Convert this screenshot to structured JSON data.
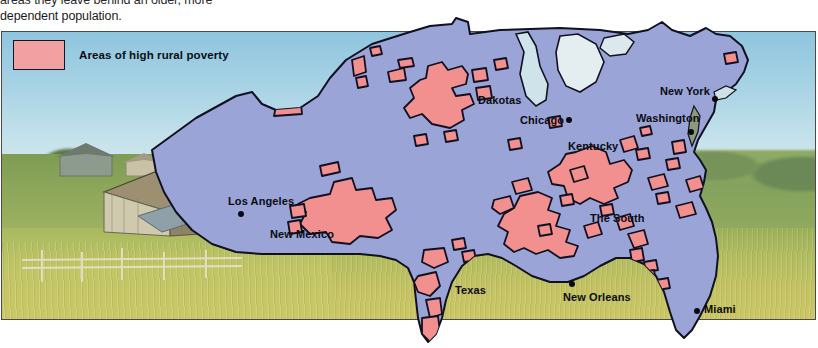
{
  "caption": {
    "line1": "areas they leave behind an older, more",
    "line2": "dependent population."
  },
  "legend": {
    "swatch_name": "poverty-area-swatch",
    "label": "Areas of high rural poverty",
    "swatch_color": "#f2a0a2",
    "swatch_border": "#15151a"
  },
  "map": {
    "title": "United States rural poverty map",
    "land_color": "#9aa4d6",
    "land_outline": "#101020",
    "poverty_color": "#f2908f",
    "poverty_outline": "#101020",
    "regions": [
      {
        "name": "Dakotas",
        "label": "Dakotas",
        "x": 478,
        "y": 100
      },
      {
        "name": "Kentucky",
        "label": "Kentucky",
        "x": 568,
        "y": 146
      },
      {
        "name": "The South",
        "label": "The South",
        "x": 590,
        "y": 218
      },
      {
        "name": "New Mexico",
        "label": "New Mexico",
        "x": 270,
        "y": 234
      },
      {
        "name": "Texas",
        "label": "Texas",
        "x": 455,
        "y": 290
      }
    ],
    "cities": [
      {
        "name": "Chicago",
        "label": "Chicago",
        "label_x": 520,
        "label_y": 120,
        "dot_x": 566,
        "dot_y": 119
      },
      {
        "name": "New York",
        "label": "New York",
        "label_x": 660,
        "label_y": 91,
        "dot_x": 712,
        "dot_y": 98
      },
      {
        "name": "Washington",
        "label": "Washington",
        "label_x": 636,
        "label_y": 118,
        "dot_x": 688,
        "dot_y": 131
      },
      {
        "name": "Los Angeles",
        "label": "Los Angeles",
        "label_x": 228,
        "label_y": 201,
        "dot_x": 238,
        "dot_y": 213
      },
      {
        "name": "New Orleans",
        "label": "New Orleans",
        "label_x": 563,
        "label_y": 297,
        "dot_x": 569,
        "dot_y": 283
      },
      {
        "name": "Miami",
        "label": "Miami",
        "label_x": 704,
        "label_y": 309,
        "dot_x": 696,
        "dot_y": 310
      }
    ]
  },
  "photo": {
    "description": "rural farm landscape with weathered barn and fence",
    "sky_color": "#a6d2e4",
    "field_color": "#c3c263"
  }
}
